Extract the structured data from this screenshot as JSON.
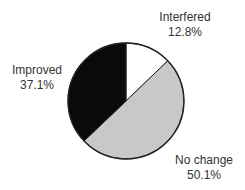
{
  "chart_data": {
    "type": "pie",
    "title": "",
    "start": "top",
    "direction": "clockwise",
    "slices": [
      {
        "label": "Interfered",
        "value": 12.8,
        "value_label": "12.8%",
        "color": "#ffffff"
      },
      {
        "label": "No change",
        "value": 50.1,
        "value_label": "50.1%",
        "color": "#c8c8c8"
      },
      {
        "label": "Improved",
        "value": 37.1,
        "value_label": "37.1%",
        "color": "#0a0a0a"
      }
    ],
    "outline_color": "#222222",
    "legend": "none"
  }
}
